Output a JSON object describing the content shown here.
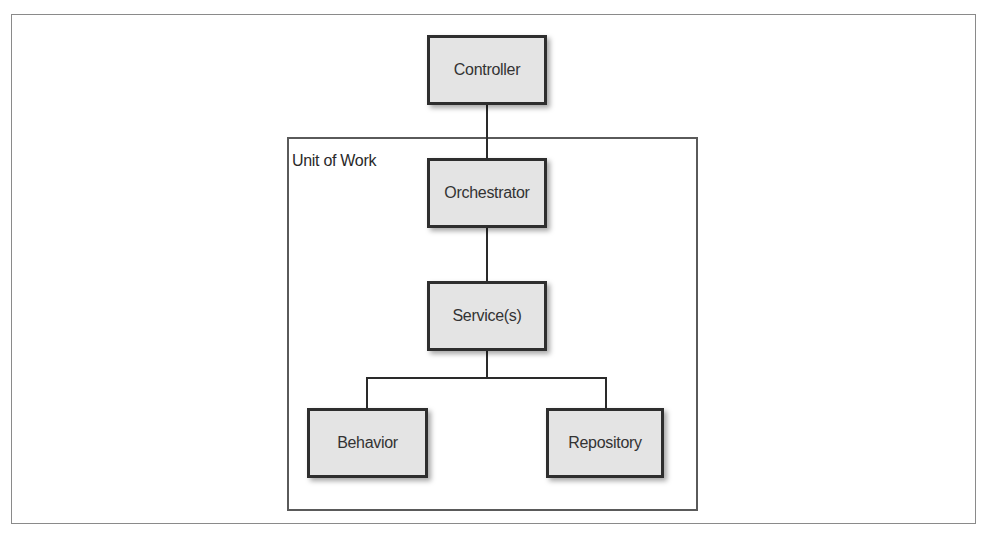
{
  "diagram": {
    "container": {
      "label": "Unit of Work"
    },
    "nodes": [
      {
        "id": "controller",
        "label": "Controller"
      },
      {
        "id": "orchestrator",
        "label": "Orchestrator"
      },
      {
        "id": "services",
        "label": "Service(s)"
      },
      {
        "id": "behavior",
        "label": "Behavior"
      },
      {
        "id": "repository",
        "label": "Repository"
      }
    ],
    "edges": [
      {
        "from": "controller",
        "to": "orchestrator"
      },
      {
        "from": "orchestrator",
        "to": "services"
      },
      {
        "from": "services",
        "to": "behavior"
      },
      {
        "from": "services",
        "to": "repository"
      }
    ]
  }
}
